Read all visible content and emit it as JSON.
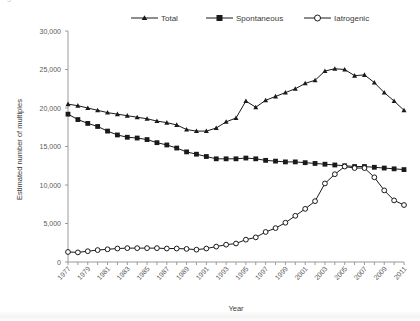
{
  "figure": {
    "background_color": "#ffffff",
    "line_color": "#1a1a1a",
    "axis_color": "#9a9a9a",
    "partial_top_text": "Figure 1"
  },
  "chart_data": {
    "type": "line",
    "title": "",
    "xlabel": "Year",
    "ylabel": "Estimated number of multiples",
    "xlim": [
      1977,
      2011
    ],
    "ylim": [
      0,
      30000
    ],
    "ytick_labels": [
      "0",
      "5,000",
      "10,000",
      "15,000",
      "20,000",
      "25,000",
      "30,000"
    ],
    "ytick_values": [
      0,
      5000,
      10000,
      15000,
      20000,
      25000,
      30000
    ],
    "xtick_labels": [
      "1977",
      "1979",
      "1981",
      "1983",
      "1985",
      "1987",
      "1989",
      "1991",
      "1993",
      "1995",
      "1997",
      "1999",
      "2001",
      "2003",
      "2005",
      "2007",
      "2009",
      "2011"
    ],
    "x": [
      1977,
      1978,
      1979,
      1980,
      1981,
      1982,
      1983,
      1984,
      1985,
      1986,
      1987,
      1988,
      1989,
      1990,
      1991,
      1992,
      1993,
      1994,
      1995,
      1996,
      1997,
      1998,
      1999,
      2000,
      2001,
      2002,
      2003,
      2004,
      2005,
      2006,
      2007,
      2008,
      2009,
      2010,
      2011
    ],
    "grid": false,
    "legend_position": "top-center",
    "series": [
      {
        "name": "Total",
        "marker": "triangle",
        "values": [
          20500,
          20300,
          20000,
          19700,
          19400,
          19200,
          19000,
          18800,
          18600,
          18300,
          18100,
          17800,
          17200,
          17000,
          17000,
          17400,
          18200,
          18700,
          20900,
          20100,
          21000,
          21500,
          22000,
          22500,
          23200,
          23600,
          24800,
          25100,
          25000,
          24200,
          24300,
          23300,
          22000,
          20900,
          19700
        ]
      },
      {
        "name": "Spontaneous",
        "marker": "square",
        "values": [
          19200,
          18500,
          18000,
          17600,
          17000,
          16500,
          16200,
          16100,
          15900,
          15500,
          15200,
          14800,
          14300,
          14000,
          13700,
          13400,
          13400,
          13400,
          13500,
          13400,
          13200,
          13100,
          13000,
          13000,
          12900,
          12800,
          12700,
          12600,
          12500,
          12400,
          12400,
          12300,
          12200,
          12100,
          12000
        ]
      },
      {
        "name": "Iatrogenic",
        "marker": "circle",
        "values": [
          1300,
          1250,
          1400,
          1550,
          1650,
          1750,
          1800,
          1800,
          1800,
          1800,
          1750,
          1750,
          1700,
          1600,
          1750,
          2000,
          2250,
          2400,
          2900,
          3200,
          3900,
          4400,
          5100,
          6000,
          6900,
          7900,
          10200,
          11400,
          12400,
          12200,
          12200,
          11000,
          9300,
          8000,
          7400
        ]
      }
    ]
  }
}
